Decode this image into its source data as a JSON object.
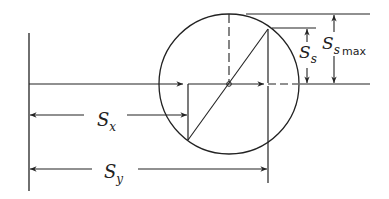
{
  "diagram": {
    "type": "Mohr circle (stress)",
    "labels": {
      "sx": {
        "main": "S",
        "sub": "x"
      },
      "sy": {
        "main": "S",
        "sub": "y"
      },
      "ss": {
        "main": "S",
        "sub": "s"
      },
      "ss_max": {
        "main": "S",
        "sub": "s",
        "suffix": "max"
      }
    },
    "colors": {
      "line": "#222222",
      "background": "#ffffff"
    }
  }
}
